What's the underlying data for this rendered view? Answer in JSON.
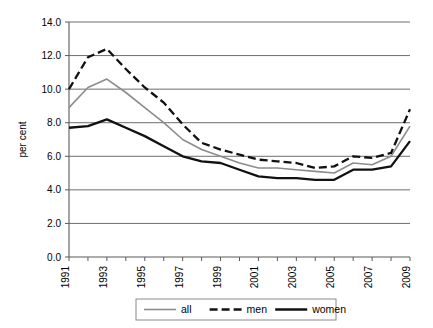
{
  "chart_data": {
    "type": "line",
    "title": "",
    "subtitle": "",
    "xlabel": "",
    "ylabel": "per cent",
    "ylim": [
      0.0,
      14.0
    ],
    "ytick_labels": [
      "14.0",
      "12.0",
      "10.0",
      "8.0",
      "6.0",
      "4.0",
      "2.0",
      "0.0"
    ],
    "ytick_values": [
      14.0,
      12.0,
      10.0,
      8.0,
      6.0,
      4.0,
      2.0,
      0.0
    ],
    "grid": "horizontal",
    "legend_position": "bottom",
    "x": [
      1991,
      1992,
      1993,
      1994,
      1995,
      1996,
      1997,
      1998,
      1999,
      2000,
      2001,
      2002,
      2003,
      2004,
      2005,
      2006,
      2007,
      2008,
      2009
    ],
    "xtick_labels": [
      "1991",
      "",
      "1993",
      "",
      "1995",
      "",
      "1997",
      "",
      "1999",
      "",
      "2001",
      "",
      "2003",
      "",
      "2005",
      "",
      "2007",
      "",
      "2009"
    ],
    "xtick_labels_shown": [
      "1991",
      "1993",
      "1995",
      "1997",
      "1999",
      "2001",
      "2003",
      "2005",
      "2007",
      "2009"
    ],
    "series": [
      {
        "name": "all",
        "color": "#8c8c8c",
        "style": "solid",
        "width": 1.6,
        "values": [
          8.9,
          10.1,
          10.6,
          9.8,
          8.9,
          8.0,
          7.0,
          6.4,
          6.0,
          5.6,
          5.3,
          5.3,
          5.2,
          5.1,
          5.0,
          5.6,
          5.5,
          6.0,
          7.8
        ]
      },
      {
        "name": "men",
        "color": "#111111",
        "style": "dashed",
        "width": 2.3,
        "values": [
          10.0,
          11.9,
          12.4,
          11.2,
          10.1,
          9.2,
          7.9,
          6.8,
          6.4,
          6.1,
          5.8,
          5.7,
          5.6,
          5.3,
          5.4,
          6.0,
          5.9,
          6.2,
          8.8
        ]
      },
      {
        "name": "women",
        "color": "#111111",
        "style": "solid",
        "width": 2.3,
        "values": [
          7.7,
          7.8,
          8.2,
          7.7,
          7.2,
          6.6,
          6.0,
          5.7,
          5.6,
          5.2,
          4.8,
          4.7,
          4.7,
          4.6,
          4.6,
          5.2,
          5.2,
          5.4,
          6.9
        ]
      }
    ]
  },
  "axis": {
    "y_title": "per cent"
  },
  "legend": {
    "items": [
      {
        "label": "all"
      },
      {
        "label": "men"
      },
      {
        "label": "women"
      }
    ]
  }
}
